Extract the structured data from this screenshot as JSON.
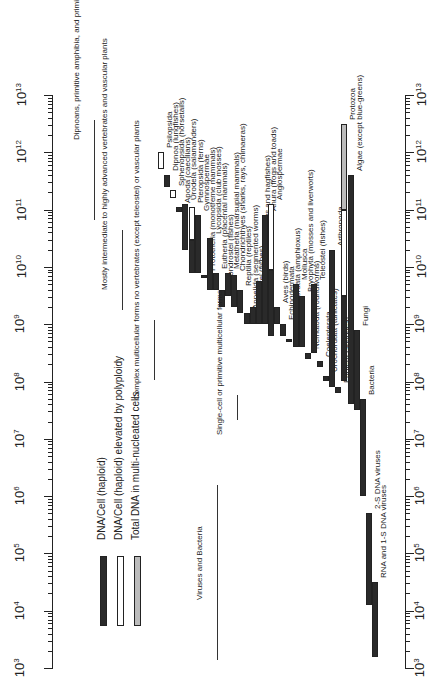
{
  "chart_data": {
    "type": "bar",
    "orientation": "rotated-90-ccw (log axis vertical, bars are ranges)",
    "title": "",
    "xlabel": "DNA per cell (nucleotide pairs)",
    "axis": {
      "scale": "log10",
      "range": [
        1000,
        10000000000000
      ],
      "ticks": [
        "10^3",
        "10^4",
        "10^5",
        "10^6",
        "10^7",
        "10^8",
        "10^9",
        "10^10",
        "10^11",
        "10^12",
        "10^13"
      ]
    },
    "legend": [
      {
        "key": "dark",
        "label": "DNA/Cell (haploid)",
        "color": "#2a2a2a"
      },
      {
        "key": "white",
        "label": "DNA/Cell (haploid) elevated by polyploidy",
        "color": "#ffffff"
      },
      {
        "key": "gray",
        "label": "Total DNA in multi-nucleated cells",
        "color": "#bbbbbb"
      }
    ],
    "groups": [
      {
        "label": "Dipnoans, primitive amphibia, and primitive vascular plants"
      },
      {
        "label": "Mostly intermediate to highly advanced vertebrates and vascular plants"
      },
      {
        "label": "Complex multicellular forms no vertebrates (except teleostei) or vascular plants"
      },
      {
        "label": "Single-cell or primitive multicellular forms"
      },
      {
        "label": "Viruses and Bacteria"
      }
    ],
    "series": [
      {
        "name": "Psilopsida",
        "min_log": 11.7,
        "max_log": 12.0,
        "kind": "white"
      },
      {
        "name": "Dipnoa (lungfishes)",
        "min_log": 11.4,
        "max_log": 11.6,
        "kind": "dark"
      },
      {
        "name": "Sphenopsida (horsetails)",
        "min_log": 11.2,
        "max_log": 11.35,
        "kind": "white"
      },
      {
        "name": "Apoda (caecilians)",
        "min_log": 10.95,
        "max_log": 11.05,
        "kind": "dark"
      },
      {
        "name": "Urodela (salamanders)",
        "min_log": 10.3,
        "max_log": 11.1,
        "kind": "dark"
      },
      {
        "name": "Pteropsida (ferns)",
        "min_log": 9.9,
        "max_log": 11.05,
        "kind": "dark+white"
      },
      {
        "name": "Gymnospermae",
        "min_log": 9.9,
        "max_log": 10.9,
        "kind": "dark"
      },
      {
        "name": "Prototheria (monotreme mammals)",
        "min_log": 9.8,
        "max_log": 9.85,
        "kind": "dark"
      },
      {
        "name": "Lycopsida (club mosses)",
        "min_log": 9.6,
        "max_log": 10.5,
        "kind": "dark"
      },
      {
        "name": "Eutheria (placental mammals)",
        "min_log": 9.6,
        "max_log": 9.9,
        "kind": "dark"
      },
      {
        "name": "Chondrostei (fishes)",
        "min_log": 9.3,
        "max_log": 9.6,
        "kind": "dark"
      },
      {
        "name": "Metatheria (marsupial mammals)",
        "min_log": 9.5,
        "max_log": 9.9,
        "kind": "dark"
      },
      {
        "name": "Chondrichthyes (sharks, rays, chimaeras)",
        "min_log": 9.3,
        "max_log": 9.85,
        "kind": "dark"
      },
      {
        "name": "Reptilia (reptiles)",
        "min_log": 9.2,
        "max_log": 9.6,
        "kind": "dark"
      },
      {
        "name": "Annelida (segmented worms)",
        "min_log": 9.0,
        "max_log": 9.2,
        "kind": "dark"
      },
      {
        "name": "Holostei (fishes)",
        "min_log": 9.0,
        "max_log": 9.3,
        "kind": "dark"
      },
      {
        "name": "Agnatha (lampreys and hagfishes)",
        "min_log": 9.0,
        "max_log": 9.75,
        "kind": "dark"
      },
      {
        "name": "Anura (frogs and toads)",
        "min_log": 9.0,
        "max_log": 10.9,
        "kind": "dark"
      },
      {
        "name": "Angiospermae",
        "min_log": 8.8,
        "max_log": 11.1,
        "kind": "dark+white"
      },
      {
        "name": "Aves (birds)",
        "min_log": 9.0,
        "max_log": 9.3,
        "kind": "dark"
      },
      {
        "name": "Echinodermata",
        "min_log": 8.8,
        "max_log": 9.0,
        "kind": "dark"
      },
      {
        "name": "Cephalochordata (amphioxus)",
        "min_log": 8.7,
        "max_log": 8.75,
        "kind": "dark"
      },
      {
        "name": "Mollusca",
        "min_log": 8.6,
        "max_log": 9.7,
        "kind": "dark"
      },
      {
        "name": "Bryophyta (mosses and liverworts)",
        "min_log": 8.6,
        "max_log": 9.5,
        "kind": "dark"
      },
      {
        "name": "Nematoda (roundworms)",
        "min_log": 8.4,
        "max_log": 8.5,
        "kind": "dark"
      },
      {
        "name": "Teleostei (fishes)",
        "min_log": 8.5,
        "max_log": 9.7,
        "kind": "dark"
      },
      {
        "name": "Coelenterata",
        "min_log": 8.25,
        "max_log": 8.35,
        "kind": "dark"
      },
      {
        "name": "Urochordata (tunicates)",
        "min_log": 8.0,
        "max_log": 8.1,
        "kind": "dark"
      },
      {
        "name": "Arthropoda",
        "min_log": 7.9,
        "max_log": 10.3,
        "kind": "dark"
      },
      {
        "name": "Porifera (sponges)",
        "min_log": 7.8,
        "max_log": 7.9,
        "kind": "dark"
      },
      {
        "name": "Protozoa",
        "min_log": 8.0,
        "max_log": 12.5,
        "kind": "dark+white+gray"
      },
      {
        "name": "Algae (except blue-greens)",
        "min_log": 7.6,
        "max_log": 11.6,
        "kind": "dark"
      },
      {
        "name": "Fungi",
        "min_log": 7.5,
        "max_log": 8.9,
        "kind": "dark"
      },
      {
        "name": "Bacteria",
        "min_log": 6.0,
        "max_log": 7.7,
        "kind": "dark"
      },
      {
        "name": "2-S DNA viruses",
        "min_log": 4.1,
        "max_log": 5.7,
        "kind": "dark"
      },
      {
        "name": "RNA and 1-S DNA viruses",
        "min_log": 3.2,
        "max_log": 4.5,
        "kind": "dark"
      }
    ]
  }
}
